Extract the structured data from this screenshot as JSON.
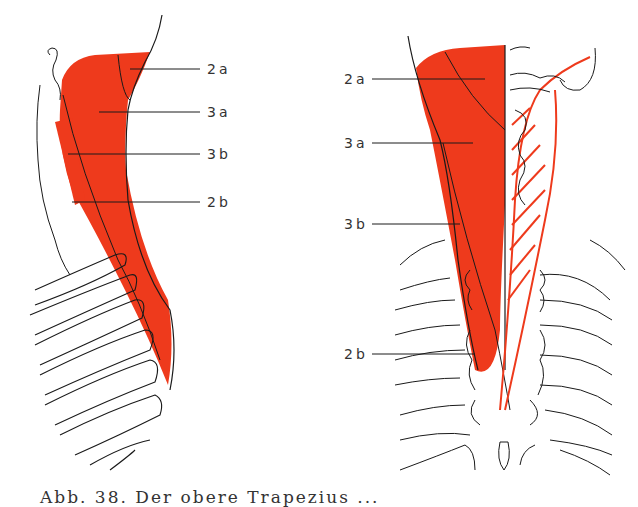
{
  "figure": {
    "colors": {
      "muscle": "#ee3a1c",
      "line": "#1a1a1a",
      "background": "#ffffff"
    },
    "left_panel": {
      "view": "lateral",
      "labels": [
        {
          "text": "2a",
          "x": 207,
          "y": 62
        },
        {
          "text": "3a",
          "x": 207,
          "y": 105
        },
        {
          "text": "3b",
          "x": 207,
          "y": 147
        },
        {
          "text": "2b",
          "x": 207,
          "y": 195
        }
      ]
    },
    "right_panel": {
      "view": "dorsal",
      "labels": [
        {
          "text": "2a",
          "x": 344,
          "y": 72
        },
        {
          "text": "3a",
          "x": 344,
          "y": 136
        },
        {
          "text": "3b",
          "x": 344,
          "y": 217
        },
        {
          "text": "2b",
          "x": 344,
          "y": 347
        }
      ]
    },
    "caption": "Abb. 38. Der obere Trapezius ..."
  }
}
